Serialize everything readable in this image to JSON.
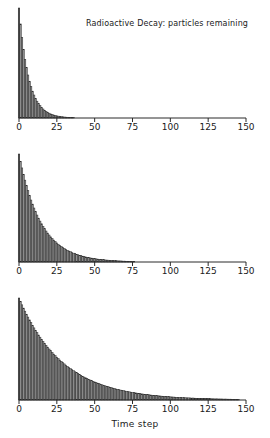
{
  "chart_data": {
    "type": "bar",
    "title": "Radioactive Decay: particles remaining",
    "xlabel": "Time step",
    "ylabel": "",
    "grid": false,
    "legend": null,
    "layout": "3 stacked panels sharing x axis, shared x range 0-150, y axis unlabeled",
    "xlim": [
      0,
      150
    ],
    "xticks": [
      0,
      25,
      50,
      75,
      100,
      125,
      150
    ],
    "xticklabels": [
      "0",
      "25",
      "50",
      "75",
      "100",
      "125",
      "150"
    ],
    "bar_fill": "#8f8f8f",
    "bar_edge": "#2b2b2b",
    "axis_color": "#2b2b2b",
    "panels": [
      {
        "name": "fast-decay",
        "ylim": [
          0,
          1000
        ],
        "bar_width": 1.0,
        "categories": [
          0,
          1,
          2,
          3,
          4,
          5,
          6,
          7,
          8,
          9,
          10,
          11,
          12,
          13,
          14,
          15,
          16,
          17,
          18,
          19,
          20,
          21,
          22,
          23,
          24,
          25,
          26,
          27,
          28,
          29,
          30,
          31,
          32,
          33,
          34,
          35,
          36,
          37,
          38,
          39,
          40,
          41,
          42,
          43,
          44,
          45,
          46,
          47,
          48,
          49
        ],
        "values": [
          1000,
          855,
          731,
          625,
          534,
          457,
          391,
          334,
          286,
          244,
          209,
          178,
          153,
          131,
          112,
          95,
          82,
          70,
          60,
          51,
          44,
          37,
          32,
          27,
          23,
          20,
          17,
          15,
          12,
          11,
          9,
          8,
          7,
          6,
          5,
          4,
          4,
          3,
          3,
          2,
          2,
          2,
          1,
          1,
          1,
          1,
          1,
          0,
          0,
          0
        ]
      },
      {
        "name": "medium-decay",
        "ylim": [
          0,
          1000
        ],
        "bar_width": 1.0,
        "categories": [
          0,
          1,
          2,
          3,
          4,
          5,
          6,
          7,
          8,
          9,
          10,
          11,
          12,
          13,
          14,
          15,
          16,
          17,
          18,
          19,
          20,
          21,
          22,
          23,
          24,
          25,
          26,
          27,
          28,
          29,
          30,
          31,
          32,
          33,
          34,
          35,
          36,
          37,
          38,
          39,
          40,
          41,
          42,
          43,
          44,
          45,
          46,
          47,
          48,
          49,
          50,
          51,
          52,
          53,
          54,
          55,
          56,
          57,
          58,
          59,
          60,
          61,
          62,
          63,
          64,
          65,
          66,
          67,
          68,
          69,
          70,
          71,
          72,
          73,
          74,
          75,
          76,
          77,
          78,
          79,
          80
        ],
        "values": [
          1000,
          933,
          871,
          812,
          758,
          707,
          660,
          616,
          574,
          536,
          500,
          466,
          435,
          406,
          379,
          354,
          330,
          308,
          287,
          268,
          250,
          233,
          218,
          203,
          190,
          177,
          165,
          154,
          144,
          134,
          125,
          117,
          109,
          102,
          95,
          88,
          82,
          77,
          72,
          67,
          62,
          58,
          54,
          51,
          47,
          44,
          41,
          38,
          36,
          33,
          31,
          29,
          27,
          25,
          24,
          22,
          21,
          19,
          18,
          17,
          16,
          15,
          14,
          13,
          12,
          11,
          10,
          10,
          9,
          8,
          8,
          7,
          7,
          6,
          6,
          5,
          4,
          3,
          2,
          1,
          0
        ]
      },
      {
        "name": "slow-decay",
        "ylim": [
          0,
          1000
        ],
        "bar_width": 1.0,
        "categories": [
          0,
          1,
          2,
          3,
          4,
          5,
          6,
          7,
          8,
          9,
          10,
          11,
          12,
          13,
          14,
          15,
          16,
          17,
          18,
          19,
          20,
          21,
          22,
          23,
          24,
          25,
          26,
          27,
          28,
          29,
          30,
          31,
          32,
          33,
          34,
          35,
          36,
          37,
          38,
          39,
          40,
          41,
          42,
          43,
          44,
          45,
          46,
          47,
          48,
          49,
          50,
          51,
          52,
          53,
          54,
          55,
          56,
          57,
          58,
          59,
          60,
          61,
          62,
          63,
          64,
          65,
          66,
          67,
          68,
          69,
          70,
          71,
          72,
          73,
          74,
          75,
          76,
          77,
          78,
          79,
          80,
          81,
          82,
          83,
          84,
          85,
          86,
          87,
          88,
          89,
          90,
          91,
          92,
          93,
          94,
          95,
          96,
          97,
          98,
          99,
          100,
          101,
          102,
          103,
          104,
          105,
          106,
          107,
          108,
          109,
          110,
          111,
          112,
          113,
          114,
          115,
          116,
          117,
          118,
          119,
          120,
          121,
          122,
          123,
          124,
          125,
          126,
          127,
          128,
          129,
          130,
          131,
          132,
          133,
          134,
          135,
          136,
          137,
          138,
          139,
          140,
          141,
          142,
          143,
          144,
          145,
          146,
          147,
          148,
          149,
          150
        ],
        "values": [
          1000,
          966,
          933,
          901,
          871,
          841,
          813,
          785,
          758,
          732,
          707,
          683,
          660,
          637,
          616,
          595,
          574,
          555,
          536,
          518,
          500,
          483,
          466,
          450,
          435,
          420,
          406,
          392,
          379,
          366,
          354,
          342,
          330,
          319,
          308,
          297,
          287,
          277,
          268,
          259,
          250,
          242,
          233,
          225,
          218,
          210,
          203,
          196,
          190,
          183,
          177,
          171,
          165,
          160,
          154,
          149,
          144,
          139,
          134,
          130,
          125,
          121,
          117,
          113,
          109,
          105,
          102,
          98,
          95,
          92,
          89,
          86,
          83,
          80,
          77,
          75,
          72,
          70,
          67,
          65,
          62,
          60,
          58,
          56,
          54,
          52,
          51,
          49,
          47,
          46,
          44,
          43,
          41,
          40,
          38,
          37,
          36,
          35,
          33,
          32,
          31,
          30,
          29,
          28,
          27,
          26,
          25,
          25,
          24,
          23,
          22,
          21,
          21,
          20,
          19,
          19,
          18,
          17,
          17,
          16,
          16,
          15,
          15,
          14,
          14,
          13,
          13,
          12,
          12,
          11,
          11,
          11,
          10,
          10,
          10,
          9,
          9,
          9,
          8,
          8,
          8,
          7,
          7,
          6,
          5,
          4,
          3,
          2,
          1,
          1,
          0
        ]
      }
    ]
  }
}
